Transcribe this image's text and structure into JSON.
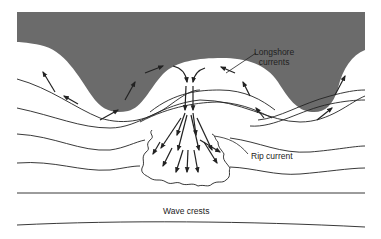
{
  "figure": {
    "type": "diagram",
    "colors": {
      "land": "#6b6b6b",
      "water": "#ffffff",
      "lines": "#222222"
    },
    "labels": {
      "longshore_line1": "Longshore",
      "longshore_line2": "currents",
      "rip_current": "Rip current",
      "wave_crests": "Wave crests"
    },
    "elements": [
      {
        "name": "land",
        "description": "Dark shaded coastline with two headlands and a central bay"
      },
      {
        "name": "longshore-currents",
        "description": "Arrows flowing along shore toward bay center"
      },
      {
        "name": "rip-current",
        "description": "Arrows flowing seaward from bay center, fanning into a wavy-edged zone"
      },
      {
        "name": "wave-crests",
        "description": "Curved lines parallel to shore, straightening offshore"
      }
    ]
  }
}
